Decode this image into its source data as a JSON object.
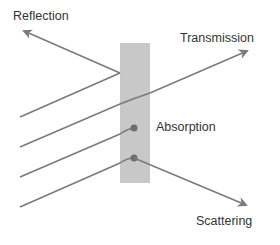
{
  "diagram": {
    "type": "light-matter interaction",
    "colors": {
      "slab": "#c8c8c8",
      "ray": "#7a7a7a",
      "text": "#333333",
      "background": "#ffffff"
    },
    "labels": {
      "reflection": "Reflection",
      "transmission": "Transmission",
      "absorption": "Absorption",
      "scattering": "Scattering"
    },
    "elements": {
      "slab": {
        "x": 120,
        "y": 43,
        "width": 30,
        "height": 140
      },
      "incident_rays": 4,
      "absorption_points": 2
    }
  }
}
